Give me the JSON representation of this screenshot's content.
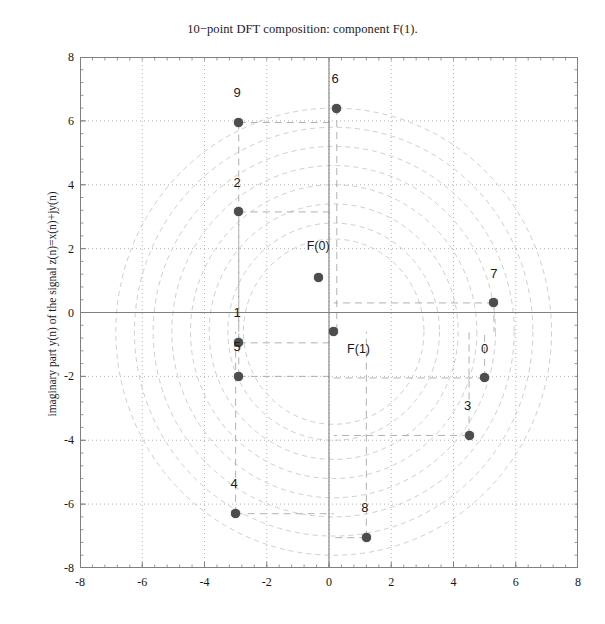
{
  "chart_data": {
    "type": "scatter",
    "title": "10−point DFT composition: component F(1).",
    "xlabel": "",
    "ylabel": "imaginary part y(n) of the signal z(n)=x(n)+jy(n)",
    "xlim": [
      -8,
      8
    ],
    "ylim": [
      -8,
      8
    ],
    "grid": true,
    "legend": "none",
    "xticks": [
      "-8",
      "-6",
      "-4",
      "-2",
      "0",
      "2",
      "4",
      "6",
      "8"
    ],
    "xtickvalues": [
      -8,
      -6,
      -4,
      -2,
      0,
      2,
      4,
      6,
      8
    ],
    "yticks": [
      "8",
      "6",
      "4",
      "2",
      "0",
      "-2",
      "-4",
      "-6",
      "-8"
    ],
    "ytickvalues": [
      8,
      6,
      4,
      2,
      0,
      -2,
      -4,
      -6,
      -8
    ],
    "points": [
      {
        "label": "0",
        "x": 5.0,
        "y": -2.05,
        "lx": 5.0,
        "ly": -1.35
      },
      {
        "label": "1",
        "x": -2.9,
        "y": -0.95,
        "lx": -2.95,
        "ly": -0.25
      },
      {
        "label": "2",
        "x": -2.9,
        "y": 3.15,
        "lx": -2.95,
        "ly": 3.85
      },
      {
        "label": "3",
        "x": 4.5,
        "y": -3.85,
        "lx": 4.45,
        "ly": -3.15
      },
      {
        "label": "4",
        "x": -3.0,
        "y": -6.3,
        "lx": -3.05,
        "ly": -5.6
      },
      {
        "label": "5",
        "x": -2.9,
        "y": -2.0,
        "lx": -2.95,
        "ly": -1.3
      },
      {
        "label": "6",
        "x": 0.25,
        "y": 6.4,
        "lx": 0.2,
        "ly": 7.1
      },
      {
        "label": "7",
        "x": 5.3,
        "y": 0.3,
        "lx": 5.3,
        "ly": 1.0
      },
      {
        "label": "8",
        "x": 1.2,
        "y": -7.05,
        "lx": 1.15,
        "ly": -6.35
      },
      {
        "label": "9",
        "x": -2.9,
        "y": 5.95,
        "lx": -2.95,
        "ly": 6.65
      }
    ],
    "components": [
      {
        "label": "F(0)",
        "x": -0.35,
        "y": 1.1,
        "lx": -0.35,
        "ly": 1.85
      },
      {
        "label": "F(1)",
        "x": 0.15,
        "y": -0.6,
        "lx": 0.95,
        "ly": -1.35
      }
    ],
    "circle_radii": [
      2.9,
      3.4,
      4.0,
      4.6,
      5.2,
      5.8,
      6.4,
      7.0
    ],
    "circle_center": [
      0.15,
      -0.6
    ],
    "colors": {
      "marker": "#4d4d4d",
      "axis": "#808080",
      "grid": "#b4b4b4",
      "circle": "#c8c8c8",
      "dashed": "#a8a8a8",
      "text": "#1b1b1b",
      "background": "#ffffff"
    }
  }
}
